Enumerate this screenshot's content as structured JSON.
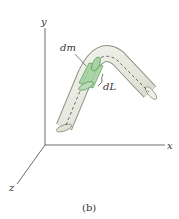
{
  "figure": {
    "caption": "(b)",
    "axes": {
      "x": "x",
      "y": "y",
      "z": "z"
    },
    "labels": {
      "mass_element": "dm",
      "length_element": "dL"
    },
    "colors": {
      "rod_fill": "#e8ebe0",
      "rod_edge": "#8a8f80",
      "element_fill": "#9fcf9a",
      "element_edge": "#4a8a4a",
      "axis": "#444444"
    }
  }
}
